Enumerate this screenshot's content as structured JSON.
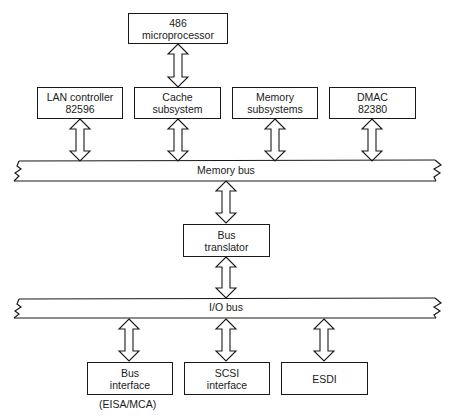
{
  "diagram": {
    "nodes": {
      "cpu": {
        "line1": "486",
        "line2": "microprocessor"
      },
      "lan": {
        "line1": "LAN controller",
        "line2": "82596"
      },
      "cache": {
        "line1": "Cache",
        "line2": "subsystem"
      },
      "memory": {
        "line1": "Memory",
        "line2": "subsystems"
      },
      "dmac": {
        "line1": "DMAC",
        "line2": "82380"
      },
      "translator": {
        "line1": "Bus",
        "line2": "translator"
      },
      "bus_interface": {
        "line1": "Bus",
        "line2": "interface",
        "note": "(EISA/MCA)"
      },
      "scsi": {
        "line1": "SCSI",
        "line2": "interface"
      },
      "esdi": {
        "line1": "ESDI"
      }
    },
    "buses": {
      "memory_bus": "Memory bus",
      "io_bus": "I/O bus"
    },
    "edges": [
      {
        "from": "486 microprocessor",
        "to": "Cache subsystem",
        "type": "bidirectional"
      },
      {
        "from": "LAN controller 82596",
        "to": "Memory bus",
        "type": "bidirectional"
      },
      {
        "from": "Cache subsystem",
        "to": "Memory bus",
        "type": "bidirectional"
      },
      {
        "from": "Memory subsystems",
        "to": "Memory bus",
        "type": "bidirectional"
      },
      {
        "from": "DMAC 82380",
        "to": "Memory bus",
        "type": "bidirectional"
      },
      {
        "from": "Memory bus",
        "to": "Bus translator",
        "type": "bidirectional"
      },
      {
        "from": "Bus translator",
        "to": "I/O bus",
        "type": "bidirectional"
      },
      {
        "from": "I/O bus",
        "to": "Bus interface",
        "type": "bidirectional"
      },
      {
        "from": "I/O bus",
        "to": "SCSI interface",
        "type": "bidirectional"
      },
      {
        "from": "I/O bus",
        "to": "ESDI",
        "type": "bidirectional"
      }
    ],
    "colors": {
      "stroke": "#1a1a1a",
      "background": "#ffffff"
    }
  }
}
